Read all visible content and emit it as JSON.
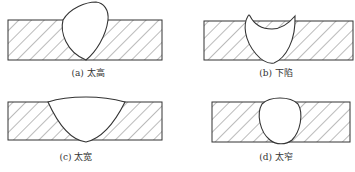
{
  "figure": {
    "panels": [
      {
        "id": "a",
        "label": "(a) 太高",
        "meaning": "too high"
      },
      {
        "id": "b",
        "label": "(b) 下陷",
        "meaning": "sunken"
      },
      {
        "id": "c",
        "label": "(c) 太宽",
        "meaning": "too wide"
      },
      {
        "id": "d",
        "label": "(d) 太窄",
        "meaning": "too narrow"
      }
    ],
    "colors": {
      "line": "#333333",
      "hatch": "#555555",
      "background": "#ffffff"
    }
  }
}
